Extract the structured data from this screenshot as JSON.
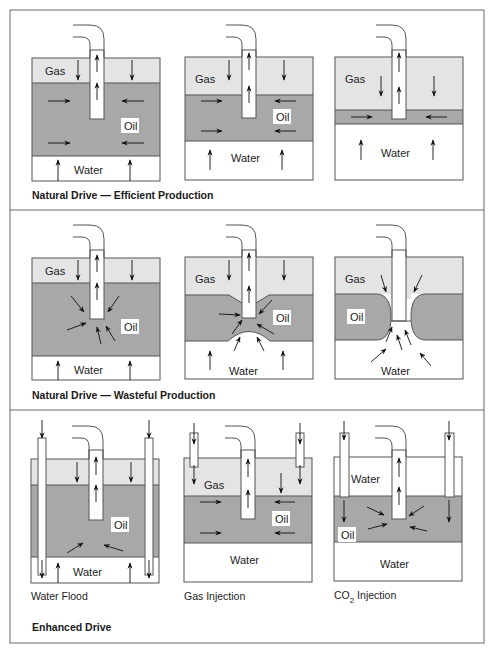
{
  "sections": [
    {
      "caption": "Natural Drive — Efficient Production",
      "panels": [
        {
          "labels": {
            "gas": "Gas",
            "oil": "Oil",
            "water": "Water"
          }
        },
        {
          "labels": {
            "gas": "Gas",
            "oil": "Oil",
            "water": "Water"
          }
        },
        {
          "labels": {
            "gas": "Gas",
            "water": "Water"
          }
        }
      ]
    },
    {
      "caption": "Natural Drive — Wasteful Production",
      "panels": [
        {
          "labels": {
            "gas": "Gas",
            "oil": "Oil",
            "water": "Water"
          }
        },
        {
          "labels": {
            "gas": "Gas",
            "oil": "Oil",
            "water": "Water"
          }
        },
        {
          "labels": {
            "gas": "Gas",
            "oil": "Oil",
            "water": "Water"
          }
        }
      ]
    },
    {
      "caption": "Enhanced Drive",
      "panels": [
        {
          "title": "Water Flood",
          "labels": {
            "oil": "Oil",
            "water": "Water"
          }
        },
        {
          "title": "Gas Injection",
          "labels": {
            "gas": "Gas",
            "oil": "Oil",
            "water": "Water"
          }
        },
        {
          "title_main": "CO",
          "title_sub": "2",
          "title_rest": " Injection",
          "labels": {
            "water_top": "Water",
            "oil": "Oil",
            "water": "Water"
          }
        }
      ]
    }
  ],
  "colors": {
    "gas": "#e4e4e4",
    "oil": "#a8a8a8",
    "water": "#ffffff",
    "outline": "#555555"
  }
}
